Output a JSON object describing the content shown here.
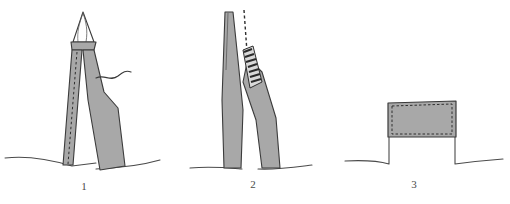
{
  "figure": {
    "background_color": "#ffffff",
    "ink_color": "#3b3b3b",
    "fill_color": "#a8a8a8",
    "fill_color_dark": "#8f8f8f",
    "panels": [
      {
        "number": "1",
        "caption": "1",
        "description": "Tall leaning split trunk with pointed splintered apex, dashed split line down the left strip, and a curved detached strip to the right",
        "elements": [
          "pointed-apex",
          "left-trunk-strip",
          "right-trunk-strip",
          "dashed-split-line",
          "curved-fiber-line",
          "ground-line"
        ]
      },
      {
        "number": "2",
        "caption": "2",
        "description": "Two separating trunk halves leaning apart with a jagged hatched break zone between them and a dashed vertical plumb line above",
        "elements": [
          "left-trunk-half",
          "right-trunk-half",
          "jagged-break-zone",
          "dashed-plumb-line",
          "ground-line"
        ]
      },
      {
        "number": "3",
        "caption": "3",
        "description": "Low wide rectangular stump block with a dashed inner border sitting on the ground line",
        "elements": [
          "stump-block",
          "dashed-inner-border",
          "ground-line"
        ]
      }
    ]
  }
}
